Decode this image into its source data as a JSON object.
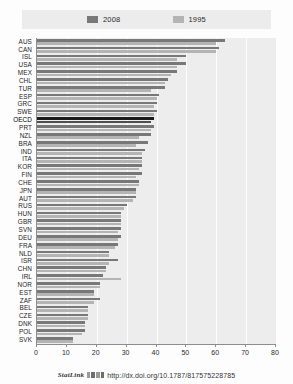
{
  "legend": {
    "entries": [
      {
        "label": "2008",
        "color": "#787878"
      },
      {
        "label": "1995",
        "color": "#b4b4b4"
      }
    ]
  },
  "footer": {
    "statlink_label": "StatLink",
    "logo_name": "statlink-logo",
    "url": "http://dx.doi.org/10.1787/817575228785"
  },
  "chart_data": {
    "type": "bar",
    "orientation": "horizontal",
    "title": "",
    "subtitle": "",
    "xlabel": "",
    "ylabel": "",
    "xlim": [
      0,
      80
    ],
    "xticks": [
      0,
      10,
      20,
      30,
      40,
      50,
      60,
      70,
      80
    ],
    "grid": true,
    "legend_position": "top",
    "highlight_category": "OECD",
    "categories": [
      "AUS",
      "CAN",
      "ISL",
      "USA",
      "MEX",
      "CHL",
      "TUR",
      "ESP",
      "GRC",
      "SWE",
      "OECD",
      "PRT",
      "NZL",
      "BRA",
      "IND",
      "ITA",
      "KOR",
      "FIN",
      "CHE",
      "JPN",
      "AUT",
      "RUS",
      "HUN",
      "GBR",
      "SVN",
      "DEU",
      "FRA",
      "NLD",
      "ISR",
      "CHN",
      "IRL",
      "NOR",
      "EST",
      "ZAF",
      "BEL",
      "CZE",
      "DNK",
      "POL",
      "SVK"
    ],
    "series": [
      {
        "name": "2008",
        "color": "#787878",
        "values": [
          63,
          61,
          50,
          50,
          47,
          44,
          43,
          41,
          40,
          40,
          39,
          39,
          38,
          37,
          36,
          35,
          35,
          35,
          34,
          33,
          33,
          30,
          28,
          28,
          28,
          28,
          27,
          24,
          27,
          23,
          22,
          21,
          19,
          21,
          17,
          17,
          16,
          16,
          12
        ]
      },
      {
        "name": "1995",
        "color": "#b4b4b4",
        "values": [
          60,
          60,
          47,
          47,
          45,
          43,
          38,
          40,
          39,
          39,
          38,
          38,
          34,
          33,
          35,
          35,
          34,
          33,
          34,
          33,
          32,
          29,
          28,
          28,
          27,
          27,
          26,
          24,
          24,
          23,
          28,
          21,
          19,
          19,
          17,
          17,
          16,
          15,
          12
        ]
      }
    ]
  }
}
